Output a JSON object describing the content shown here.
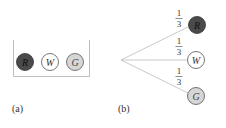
{
  "colors": {
    "line": "#bdbdbd",
    "urn_border": "#bdbdbd",
    "red_ball_fill": "#4a4a4a",
    "white_ball_fill": "#ffffff",
    "green_ball_fill": "#d6d6d6",
    "ball_stroke": "#555555",
    "text": "#333333"
  },
  "panel_a": {
    "caption": "(a)",
    "balls": [
      {
        "letter": "R",
        "fill": "dark"
      },
      {
        "letter": "W",
        "fill": "white"
      },
      {
        "letter": "G",
        "fill": "light-gray"
      }
    ]
  },
  "panel_b": {
    "caption": "(b)",
    "branches": [
      {
        "probability_num": "1",
        "probability_den": "3",
        "outcome": "R"
      },
      {
        "probability_num": "1",
        "probability_den": "3",
        "outcome": "W"
      },
      {
        "probability_num": "1",
        "probability_den": "3",
        "outcome": "G"
      }
    ]
  }
}
